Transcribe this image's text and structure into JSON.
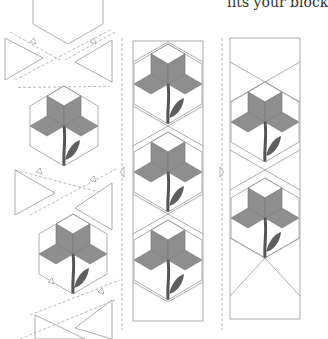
{
  "caption": {
    "text": "fits your block"
  },
  "colors": {
    "petal": "#8e8e8e",
    "stem": "#555555",
    "leaf": "#5e5e5e",
    "outline": "#999999",
    "dashed": "#a8a8a8",
    "background": "#ffffff"
  },
  "panels": [
    {
      "name": "exploded-assembly",
      "description": "Hexagons and setting triangles separated along dashed seam lines"
    },
    {
      "name": "sewn-strip-with-seams",
      "description": "Three flower hexagons joined in a vertical strip",
      "flowers": 3
    },
    {
      "name": "finished-strip",
      "description": "Two flower hexagons in a trimmed strip",
      "flowers": 2
    }
  ]
}
